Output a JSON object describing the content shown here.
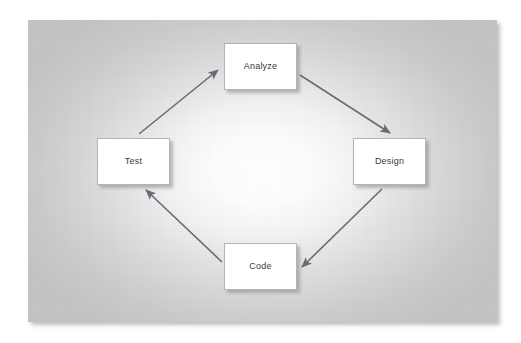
{
  "diagram": {
    "type": "cycle",
    "direction": "clockwise",
    "panel": {
      "background_center_color": "#ffffff",
      "background_edge_color": "#c4c4c4"
    },
    "node_style": {
      "fill": "#ffffff",
      "border_color": "#b4b4b4",
      "text_color": "#3a3a3a"
    },
    "arrow_style": {
      "color": "#6a6a78"
    },
    "nodes": [
      {
        "id": "analyze",
        "label": "Analyze",
        "position": "top"
      },
      {
        "id": "design",
        "label": "Design",
        "position": "right"
      },
      {
        "id": "code",
        "label": "Code",
        "position": "bottom"
      },
      {
        "id": "test",
        "label": "Test",
        "position": "left"
      }
    ],
    "edges": [
      {
        "id": "test-to-analyze",
        "from": "test",
        "to": "analyze",
        "label": ""
      },
      {
        "id": "analyze-to-design",
        "from": "analyze",
        "to": "design",
        "label": ""
      },
      {
        "id": "design-to-code",
        "from": "design",
        "to": "code",
        "label": ""
      },
      {
        "id": "code-to-test",
        "from": "code",
        "to": "test",
        "label": ""
      }
    ]
  }
}
